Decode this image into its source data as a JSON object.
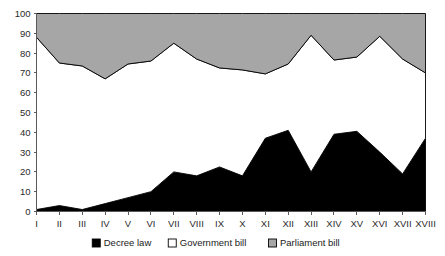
{
  "chart_data": {
    "type": "area",
    "title": "",
    "subtitle": "",
    "xlabel": "",
    "ylabel": "",
    "stacked": true,
    "stack_total": 100,
    "grid": false,
    "legend_position": "bottom",
    "xlim": [
      0,
      17
    ],
    "ylim": [
      0,
      100
    ],
    "y_ticks": [
      0,
      10,
      20,
      30,
      40,
      50,
      60,
      70,
      80,
      90,
      100
    ],
    "y_tick_labels": [
      "0",
      "10",
      "20",
      "30",
      "40",
      "50",
      "60",
      "70",
      "80",
      "90",
      "100"
    ],
    "categories": [
      "I",
      "II",
      "III",
      "IV",
      "V",
      "VI",
      "VII",
      "VIII",
      "IX",
      "X",
      "XI",
      "XII",
      "XIII",
      "XIV",
      "XV",
      "XVI",
      "XVII",
      "XVIII"
    ],
    "series": [
      {
        "name": "Decree law",
        "color": "#000000",
        "values": [
          1,
          3,
          1,
          4,
          7,
          10,
          20,
          18,
          22.5,
          18,
          37,
          41,
          20,
          39,
          40.5,
          30,
          19,
          37
        ]
      },
      {
        "name": "Government bill",
        "color": "#ffffff",
        "values": [
          87,
          72,
          72.5,
          63,
          67.5,
          66,
          65,
          59,
          50,
          53.5,
          32.5,
          33.5,
          69,
          37.5,
          37.5,
          58.5,
          58,
          33
        ]
      },
      {
        "name": "Parliament bill",
        "color": "#a6a6a6",
        "values": [
          12,
          25,
          26.5,
          33,
          25.5,
          24,
          15,
          23,
          27.5,
          28.5,
          30.5,
          25.5,
          11,
          23.5,
          22,
          11.5,
          23,
          30
        ]
      }
    ],
    "cumulative_decree": [
      1,
      3,
      1,
      4,
      7,
      10,
      20,
      18,
      22.5,
      18,
      37,
      41,
      20,
      39,
      40.5,
      30,
      19,
      37
    ],
    "cumulative_government": [
      88,
      75,
      73.5,
      67,
      74.5,
      76,
      85,
      77,
      72.5,
      71.5,
      69.5,
      74.5,
      89,
      76.5,
      78,
      88.5,
      77,
      70
    ],
    "cumulative_parliament": [
      100,
      100,
      100,
      100,
      100,
      100,
      100,
      100,
      100,
      100,
      100,
      100,
      100,
      100,
      100,
      100,
      100,
      100
    ]
  },
  "legend": {
    "items": [
      {
        "label": "Decree law",
        "color": "#000000"
      },
      {
        "label": "Government bill",
        "color": "#ffffff"
      },
      {
        "label": "Parliament bill",
        "color": "#a6a6a6"
      }
    ]
  },
  "colors": {
    "decree_law": "#000000",
    "government_bill": "#ffffff",
    "parliament_bill": "#a6a6a6",
    "axis": "#5a5a5a",
    "text": "#2b2b2b",
    "background": "#ffffff"
  }
}
